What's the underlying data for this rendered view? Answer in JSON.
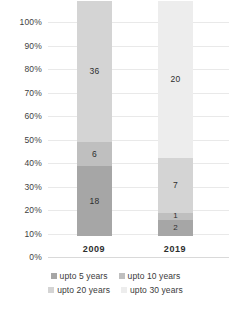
{
  "chart_data": {
    "type": "bar",
    "subtype": "stacked-percent",
    "title": "",
    "subtitle": "",
    "xlabel": "",
    "ylabel": "",
    "categories": [
      "2009",
      "2019"
    ],
    "ylim": [
      0,
      100
    ],
    "ytick_labels": [
      "0%",
      "10%",
      "20%",
      "30%",
      "40%",
      "50%",
      "60%",
      "70%",
      "80%",
      "90%",
      "100%"
    ],
    "ytick_values": [
      0,
      10,
      20,
      30,
      40,
      50,
      60,
      70,
      80,
      90,
      100
    ],
    "grid": true,
    "legend_position": "bottom",
    "series": [
      {
        "name": "upto 5 years",
        "color": "#a6a6a6",
        "values": [
          18,
          2
        ],
        "labels": [
          "18",
          "2"
        ],
        "percents": [
          30.0,
          6.7
        ]
      },
      {
        "name": "upto 10 years",
        "color": "#bfbfbf",
        "values": [
          6,
          1
        ],
        "labels": [
          "6",
          "1"
        ],
        "percents": [
          10.0,
          3.3
        ]
      },
      {
        "name": "upto 20 years",
        "color": "#d4d4d4",
        "values": [
          36,
          7
        ],
        "labels": [
          "36",
          "7"
        ],
        "percents": [
          60.0,
          23.3
        ]
      },
      {
        "name": "upto 30 years",
        "color": "#ededed",
        "values": [
          0,
          20
        ],
        "labels": [
          "",
          "20"
        ],
        "percents": [
          0.0,
          66.7
        ]
      }
    ],
    "totals": [
      60,
      30
    ]
  },
  "axis": {
    "y_ticks": [
      {
        "label": "100%",
        "value": 100
      },
      {
        "label": "90%",
        "value": 90
      },
      {
        "label": "80%",
        "value": 80
      },
      {
        "label": "70%",
        "value": 70
      },
      {
        "label": "60%",
        "value": 60
      },
      {
        "label": "50%",
        "value": 50
      },
      {
        "label": "40%",
        "value": 40
      },
      {
        "label": "30%",
        "value": 30
      },
      {
        "label": "20%",
        "value": 20
      },
      {
        "label": "10%",
        "value": 10
      },
      {
        "label": "0%",
        "value": 0
      }
    ],
    "x_ticks": [
      {
        "label": "2009"
      },
      {
        "label": "2019"
      }
    ]
  },
  "legend": {
    "rows": [
      [
        {
          "label": "upto 5 years",
          "color": "#a6a6a6"
        },
        {
          "label": "upto 10 years",
          "color": "#bfbfbf"
        }
      ],
      [
        {
          "label": "upto 20 years",
          "color": "#d4d4d4"
        },
        {
          "label": "upto 30 years",
          "color": "#ededed"
        }
      ]
    ]
  },
  "colors": {
    "background": "#ffffff",
    "gridline": "#e9e9e9",
    "baseline": "#d9d9d9",
    "text": "#3a3a3a"
  }
}
